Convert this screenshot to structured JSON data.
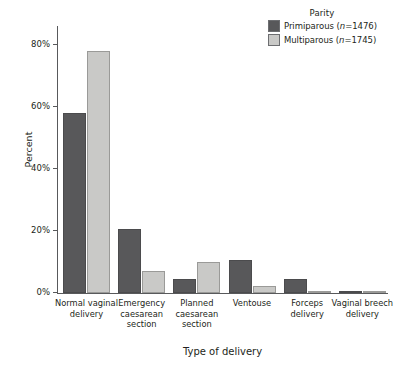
{
  "chart_data": {
    "type": "bar",
    "title": "",
    "xlabel": "Type of delivery",
    "ylabel": "Percent",
    "ylim": [
      0,
      85
    ],
    "ytick_values": [
      0,
      20,
      40,
      60,
      80
    ],
    "ytick_labels": [
      "0%",
      "20%",
      "40%",
      "60%",
      "80%"
    ],
    "grid": false,
    "legend_position": "top-right",
    "legend_title": "Parity",
    "categories": [
      "Normal vaginal delivery",
      "Emergency caesarean section",
      "Planned caesarean section",
      "Ventouse",
      "Forceps delivery",
      "Vaginal breech delivery"
    ],
    "category_lines": [
      [
        "Normal vaginal",
        "delivery"
      ],
      [
        "Emergency",
        "caesarean",
        "section"
      ],
      [
        "Planned",
        "caesarean",
        "section"
      ],
      [
        "Ventouse"
      ],
      [
        "Forceps",
        "delivery"
      ],
      [
        "Vaginal breech",
        "delivery"
      ]
    ],
    "series": [
      {
        "name": "Primiparous (n=1476)",
        "name_prefix": "Primiparous (",
        "name_italic": "n",
        "name_suffix": "=1476)",
        "color": "#58585a",
        "values": [
          58.0,
          20.5,
          4.5,
          10.5,
          4.5,
          0.3
        ]
      },
      {
        "name": "Multiparous (n=1745)",
        "name_prefix": "Multiparous (",
        "name_italic": "n",
        "name_suffix": "=1745)",
        "color": "#c9c9c7",
        "values": [
          78.0,
          7.0,
          10.0,
          2.2,
          0.5,
          0.4
        ]
      }
    ]
  }
}
